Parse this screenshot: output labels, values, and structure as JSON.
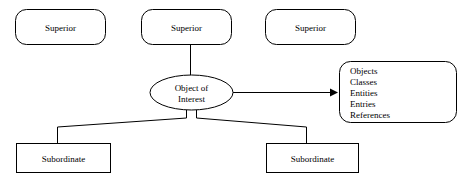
{
  "diagram": {
    "type": "object-relationship-diagram",
    "background_color": "#ffffff",
    "line_color": "#000000",
    "text_color": "#000000",
    "superiors": [
      {
        "label": "Superior"
      },
      {
        "label": "Superior"
      },
      {
        "label": "Superior"
      }
    ],
    "center": {
      "label_line1": "Object of",
      "label_line2": "Interest"
    },
    "subordinates": [
      {
        "label": "Subordinate"
      },
      {
        "label": "Subordinate"
      }
    ],
    "synonym_list": {
      "items": [
        "Objects",
        "Classes",
        "Entities",
        "Entries",
        "References"
      ]
    }
  }
}
